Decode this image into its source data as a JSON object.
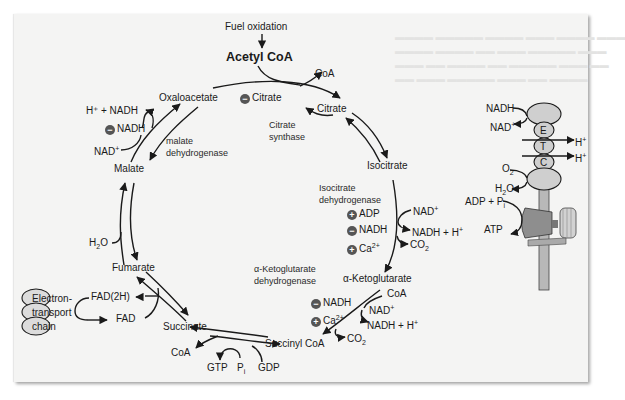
{
  "figure": {
    "header": {
      "fuel_oxidation": "Fuel oxidation",
      "acetyl_coa": "Acetyl CoA"
    },
    "intermediates": {
      "oxaloacetate": "Oxaloacetate",
      "citrate": "Citrate",
      "isocitrate": "Isocitrate",
      "alpha_ketoglutarate": "α-Ketoglutarate",
      "succinyl_coa": "Succinyl CoA",
      "succinate": "Succinate",
      "fumarate": "Fumarate",
      "malate": "Malate"
    },
    "enzymes": {
      "citrate_synthase_1": "Citrate",
      "citrate_synthase_2": "synthase",
      "isocitrate_dh_1": "Isocitrate",
      "isocitrate_dh_2": "dehydrogenase",
      "akg_dh_1": "α-Ketoglutarate",
      "akg_dh_2": "dehydrogenase",
      "malate_dh_1": "malate",
      "malate_dh_2": "dehydrogenase"
    },
    "regulators": {
      "citrate_synthase": [
        {
          "sign": "−",
          "label": "Citrate"
        }
      ],
      "isocitrate_dh": [
        {
          "sign": "+",
          "label": "ADP"
        },
        {
          "sign": "−",
          "label": "NADH"
        },
        {
          "sign": "+",
          "label": "Ca",
          "sup": "2+"
        }
      ],
      "akg_dh": [
        {
          "sign": "−",
          "label": "NADH"
        },
        {
          "sign": "+",
          "label": "Ca",
          "sup": "2+"
        }
      ],
      "malate_dh": [
        {
          "sign": "−",
          "label": "NADH"
        }
      ]
    },
    "cofactors": {
      "coa_citrate": "CoA",
      "nad_isocitrate": "NAD",
      "nadh_isocitrate": "NADH + H",
      "co2_isocitrate": "CO",
      "coa_akg": "CoA",
      "nad_akg": "NAD",
      "nadh_akg": "NADH + H",
      "co2_akg": "CO",
      "coa_succinyl": "CoA",
      "gtp": "GTP",
      "pi": "P",
      "pi_sub": "i",
      "gdp": "GDP",
      "fad2h": "FAD(2H)",
      "fad": "FAD",
      "h2o_fumarase": "H",
      "nad_malate": "NAD",
      "nadh_malate": "H⁺ + NADH",
      "plus_sup": "+",
      "two_sub": "2"
    },
    "etc_left": {
      "line1": "Electron-",
      "line2": "transport",
      "line3": "chain"
    },
    "etc_right": {
      "nadh": "NADH",
      "nad": "NAD",
      "complex_e": "E",
      "complex_t": "T",
      "complex_c": "C",
      "h_plus_1": "H",
      "h_plus_2": "H",
      "o2": "O",
      "h2o": "H",
      "adp_pi": "ADP + P",
      "atp": "ATP"
    },
    "colors": {
      "panel": "#f4f4f3",
      "ink": "#1a1a1a",
      "modifier": "#555555",
      "etc_fill": "#cfcfcf",
      "synthase_fill": "#9a9a9a"
    }
  }
}
